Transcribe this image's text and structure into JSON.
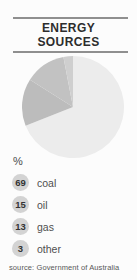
{
  "title": {
    "line1": "ENERGY",
    "line2": "SOURCES"
  },
  "percent_label": "%",
  "legend": [
    {
      "value": "69",
      "label": "coal"
    },
    {
      "value": "15",
      "label": "oil"
    },
    {
      "value": "13",
      "label": "gas"
    },
    {
      "value": "3",
      "label": "other"
    }
  ],
  "source": "source: Government of Australia",
  "colors": {
    "rule": "#8f8f8f",
    "title_text": "#2d2d2d",
    "legend_badge": "#d3d3d3",
    "legend_text": "#4f4f4f",
    "source_text": "#585858"
  },
  "chart_data": {
    "type": "pie",
    "title": "ENERGY SOURCES",
    "unit": "%",
    "categories": [
      "coal",
      "oil",
      "gas",
      "other"
    ],
    "values": [
      69,
      15,
      13,
      3
    ],
    "slice_colors": [
      "#ececec",
      "#bcbcbc",
      "#c2c2c2",
      "#cfcfcf"
    ],
    "start_angle_deg": 0,
    "direction": "clockwise",
    "legend_position": "bottom",
    "source": "source: Government of Australia"
  }
}
